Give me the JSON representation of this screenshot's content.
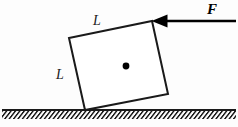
{
  "figure": {
    "background_color": "#fdfdfd",
    "stroke_color": "#1a1a1a",
    "labels": {
      "side_top": "L",
      "side_left": "L",
      "force": "F"
    },
    "block": {
      "shape": "square",
      "side_label": "L",
      "corners": {
        "top_left": [
          69,
          38
        ],
        "top_right": [
          152,
          21
        ],
        "bottom_right": [
          168,
          94
        ],
        "bottom_left": [
          85,
          110
        ]
      },
      "center_of_mass": [
        126,
        66
      ],
      "center_dot_radius": 3.4,
      "stroke_width": 2.0
    },
    "force_arrow": {
      "label": "F",
      "direction": "left",
      "tail": [
        236,
        21
      ],
      "tip": [
        152,
        21
      ],
      "shaft_width": 2.4,
      "head_length": 15,
      "head_half_height": 6.5
    },
    "ground": {
      "line_y": 110,
      "x_start": 2,
      "x_end": 236,
      "line_width": 2.0,
      "hatch_depth": 8,
      "hatch_spacing": 4.4,
      "hatch_angle_label": "45-deg-right-leaning"
    }
  }
}
